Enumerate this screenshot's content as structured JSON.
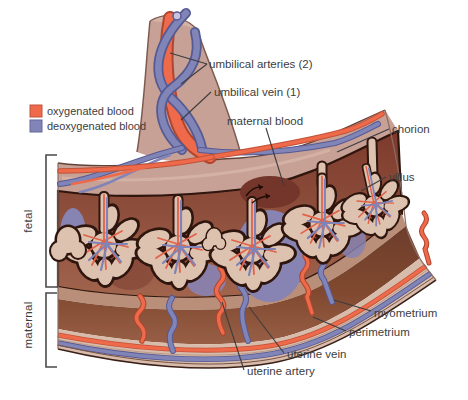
{
  "diagram": {
    "legend": {
      "items": [
        {
          "name": "oxygenated",
          "label": "oxygenated blood",
          "color": "#ee6a4b"
        },
        {
          "name": "deoxygenated",
          "label": "deoxygenated blood",
          "color": "#8084b6"
        }
      ]
    },
    "side_brackets": [
      {
        "label": "fetal"
      },
      {
        "label": "maternal"
      }
    ],
    "callouts": {
      "umbilical_arteries": "umbilical arteries (2)",
      "umbilical_vein": "umbilical vein (1)",
      "maternal_blood": "maternal blood",
      "chorion": "chorion",
      "villus": "villus",
      "myometrium": "myometrium",
      "perimetrium": "perimetrium",
      "uterine_vein": "uterine vein",
      "uterine_artery": "uterine artery"
    },
    "colors": {
      "oxygenated": "#ee6a4b",
      "deoxygenated": "#8084b6",
      "tissue": "#c7a096",
      "villus": "#ddc2b0",
      "intervillous_space": "#8a4334",
      "myometrium": "#7f4a37",
      "outline": "#2e150d",
      "label_text": "#3d3d3d"
    }
  }
}
